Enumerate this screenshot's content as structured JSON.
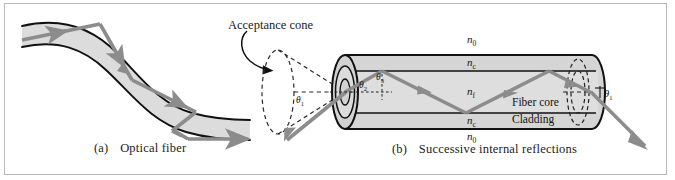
{
  "figure": {
    "background": "#ffffff",
    "frame_color": "#b9b9bd",
    "fill_gray": "#d9d9d9",
    "core_gray": "#e0e0e0",
    "outline": "#111111",
    "ray_color": "#8c8c8c",
    "ray_color_dark": "#808080"
  },
  "panel_a": {
    "caption": "(a)  Optical fiber",
    "caption_label": "(a)",
    "caption_text": "Optical fiber",
    "description": "Curved optical fiber with zigzag totally-internally-reflected ray"
  },
  "panel_b": {
    "caption": "(b)  Successive internal reflections",
    "caption_label": "(b)",
    "caption_text": "Successive internal reflections",
    "acceptance_cone_label": "Acceptance cone",
    "fiber_core_label": "Fiber core",
    "cladding_label": "Cladding",
    "indices": {
      "n0_top": "n",
      "n0_top_sub": "0",
      "nc_top": "n",
      "nc_top_sub": "c",
      "nf_mid": "n",
      "nf_mid_sub": "f",
      "nc_bottom": "n",
      "nc_bottom_sub": "c",
      "n0_bottom": "n",
      "n0_bottom_sub": "0"
    },
    "angles": {
      "theta1_entrance": "θ",
      "theta1_entrance_sub": "1",
      "theta2": "θ",
      "theta2_sub": "2",
      "theta3": "θ",
      "theta3_sub": "3",
      "theta1_exit": "θ",
      "theta1_exit_sub": "1"
    }
  }
}
